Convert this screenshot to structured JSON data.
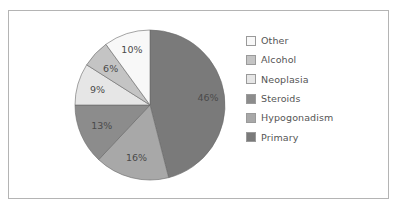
{
  "chart_data": {
    "type": "pie",
    "title": "",
    "categories": [
      "Primary",
      "Hypogonadism",
      "Steroids",
      "Neoplasia",
      "Alcohol",
      "Other"
    ],
    "values": [
      46,
      16,
      13,
      9,
      6,
      10
    ],
    "labels": [
      "46%",
      "16%",
      "13%",
      "9%",
      "6%",
      "10%"
    ],
    "colors": [
      "#7a7a7a",
      "#a8a8a8",
      "#8c8c8c",
      "#e6e6e6",
      "#c4c4c4",
      "#f8f8f8"
    ],
    "start_angle": "12 o'clock",
    "direction": "clockwise",
    "legend_position": "right",
    "legend_order": [
      "Other",
      "Alcohol",
      "Neoplasia",
      "Steroids",
      "Hypogonadism",
      "Primary"
    ]
  },
  "legend": {
    "items": [
      {
        "label": "Other",
        "color": "#f8f8f8"
      },
      {
        "label": "Alcohol",
        "color": "#c4c4c4"
      },
      {
        "label": "Neoplasia",
        "color": "#e6e6e6"
      },
      {
        "label": "Steroids",
        "color": "#8c8c8c"
      },
      {
        "label": "Hypogonadism",
        "color": "#a8a8a8"
      },
      {
        "label": "Primary",
        "color": "#7a7a7a"
      }
    ]
  }
}
